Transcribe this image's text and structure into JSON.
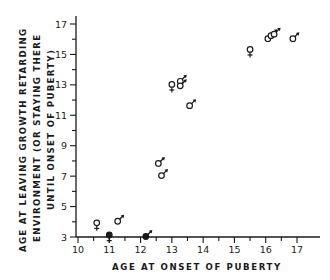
{
  "chart_data": {
    "type": "scatter",
    "title": "",
    "xlabel": "AGE AT ONSET OF PUBERTY",
    "ylabel_lines": [
      "AGE AT LEAVING GROWTH RETARDING",
      "ENVIRONMENT (OR STAYING THERE",
      "UNTIL ONSET OF PUBERTY)"
    ],
    "xlim": [
      10,
      17
    ],
    "ylim": [
      3,
      17
    ],
    "x_ticks": [
      10,
      11,
      12,
      13,
      14,
      15,
      16,
      17
    ],
    "y_ticks": [
      3,
      5,
      7,
      9,
      11,
      13,
      15,
      17
    ],
    "grid": false,
    "legend": "none (points marked with sex symbols: ♀ female, ♂ male)",
    "series": [
      {
        "name": "female",
        "symbol": "♀",
        "points": [
          {
            "x": 10.6,
            "y": 3.8
          },
          {
            "x": 11.0,
            "y": 3.0,
            "filled": true
          },
          {
            "x": 13.0,
            "y": 12.9
          },
          {
            "x": 15.5,
            "y": 15.2
          }
        ]
      },
      {
        "name": "male",
        "symbol": "♂",
        "points": [
          {
            "x": 11.3,
            "y": 4.1
          },
          {
            "x": 12.2,
            "y": 3.1,
            "filled": true
          },
          {
            "x": 12.6,
            "y": 7.9
          },
          {
            "x": 12.7,
            "y": 7.1
          },
          {
            "x": 13.3,
            "y": 13.3
          },
          {
            "x": 13.3,
            "y": 13.0
          },
          {
            "x": 13.6,
            "y": 11.7
          },
          {
            "x": 16.1,
            "y": 16.1
          },
          {
            "x": 16.2,
            "y": 16.3
          },
          {
            "x": 16.3,
            "y": 16.4
          },
          {
            "x": 16.9,
            "y": 16.1
          }
        ]
      }
    ]
  },
  "axes": {
    "x_tick_labels": [
      "10",
      "11",
      "12",
      "13",
      "14",
      "15",
      "16",
      "17"
    ],
    "y_tick_labels": [
      "3",
      "5",
      "7",
      "9",
      "11",
      "13",
      "15",
      "17"
    ]
  }
}
